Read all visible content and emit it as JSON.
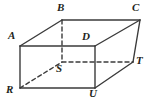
{
  "figure": {
    "name": "rectangular-prism",
    "background_color": "#ffffff",
    "edge_color": "#3b3b3b",
    "label_color": "#231f20",
    "edge_width": 1.4,
    "hidden_edge_dash": "4,3"
  },
  "vertices": [
    {
      "id": "A",
      "label": "A",
      "x": 20,
      "y": 46,
      "label_x": 8,
      "label_y": 30,
      "hidden": false
    },
    {
      "id": "B",
      "label": "B",
      "x": 62,
      "y": 20,
      "label_x": 57,
      "label_y": 2,
      "hidden": false
    },
    {
      "id": "C",
      "label": "C",
      "x": 140,
      "y": 20,
      "label_x": 132,
      "label_y": 2,
      "hidden": false
    },
    {
      "id": "D",
      "label": "D",
      "x": 95,
      "y": 46,
      "label_x": 82,
      "label_y": 31,
      "hidden": false
    },
    {
      "id": "R",
      "label": "R",
      "x": 20,
      "y": 88,
      "label_x": 6,
      "label_y": 84,
      "hidden": false
    },
    {
      "id": "S",
      "label": "S",
      "x": 62,
      "y": 62,
      "label_x": 56,
      "label_y": 63,
      "hidden": true
    },
    {
      "id": "T",
      "label": "T",
      "x": 133,
      "y": 62,
      "label_x": 136,
      "label_y": 55,
      "hidden": false
    },
    {
      "id": "U",
      "label": "U",
      "x": 95,
      "y": 88,
      "label_x": 89,
      "label_y": 88,
      "hidden": false
    }
  ],
  "edges": [
    {
      "from": "A",
      "to": "B",
      "style": "solid",
      "face": "top"
    },
    {
      "from": "B",
      "to": "C",
      "style": "solid",
      "face": "top"
    },
    {
      "from": "C",
      "to": "D",
      "style": "solid",
      "face": "top"
    },
    {
      "from": "D",
      "to": "A",
      "style": "solid",
      "face": "top"
    },
    {
      "from": "A",
      "to": "R",
      "style": "solid",
      "face": "front"
    },
    {
      "from": "D",
      "to": "U",
      "style": "solid",
      "face": "front"
    },
    {
      "from": "R",
      "to": "U",
      "style": "solid",
      "face": "front"
    },
    {
      "from": "C",
      "to": "T",
      "style": "solid",
      "face": "right"
    },
    {
      "from": "U",
      "to": "T",
      "style": "solid",
      "face": "right"
    },
    {
      "from": "B",
      "to": "S",
      "style": "dashed",
      "face": "hidden"
    },
    {
      "from": "S",
      "to": "T",
      "style": "dashed",
      "face": "hidden"
    },
    {
      "from": "R",
      "to": "S",
      "style": "dashed",
      "face": "hidden"
    }
  ]
}
